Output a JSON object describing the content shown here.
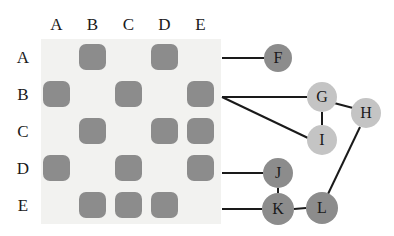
{
  "figure": {
    "colors": {
      "matrix_background": "#f2f2f0",
      "filled_cell": "#8c8c8c",
      "node_dark": "#8c8c8c",
      "node_light": "#c4c4c4",
      "edge": "#1a1a1a",
      "text": "#1a1a1a",
      "page_background": "#ffffff"
    }
  },
  "matrix": {
    "column_headers": [
      "A",
      "B",
      "C",
      "D",
      "E"
    ],
    "row_headers": [
      "A",
      "B",
      "C",
      "D",
      "E"
    ],
    "rows": [
      {
        "label": "A",
        "cells": [
          0,
          1,
          0,
          1,
          0
        ]
      },
      {
        "label": "B",
        "cells": [
          1,
          0,
          1,
          0,
          1
        ]
      },
      {
        "label": "C",
        "cells": [
          0,
          1,
          0,
          1,
          1
        ]
      },
      {
        "label": "D",
        "cells": [
          1,
          0,
          1,
          0,
          1
        ]
      },
      {
        "label": "E",
        "cells": [
          0,
          1,
          1,
          1,
          0
        ]
      }
    ],
    "geometry": {
      "left": 41,
      "top": 39,
      "width": 180,
      "height": 185,
      "col_x": [
        43,
        79,
        115,
        151,
        187
      ],
      "row_y": [
        44,
        81,
        118,
        155,
        192
      ],
      "cell_size": 27
    }
  },
  "graph": {
    "nodes": [
      {
        "id": "F",
        "label": "F",
        "x": 278,
        "y": 58,
        "r": 14,
        "shade": "dark"
      },
      {
        "id": "G",
        "label": "G",
        "x": 322,
        "y": 97,
        "r": 15,
        "shade": "light"
      },
      {
        "id": "H",
        "label": "H",
        "x": 366,
        "y": 113,
        "r": 15,
        "shade": "light"
      },
      {
        "id": "I",
        "label": "I",
        "x": 322,
        "y": 140,
        "r": 15,
        "shade": "light"
      },
      {
        "id": "J",
        "label": "J",
        "x": 278,
        "y": 173,
        "r": 15,
        "shade": "dark"
      },
      {
        "id": "K",
        "label": "K",
        "x": 278,
        "y": 209,
        "r": 16,
        "shade": "dark"
      },
      {
        "id": "L",
        "label": "L",
        "x": 322,
        "y": 208,
        "r": 16,
        "shade": "dark"
      }
    ],
    "edges": [
      {
        "from": "row-A",
        "to": "F",
        "x1": 222,
        "y1": 58,
        "x2": 264,
        "y2": 58
      },
      {
        "from": "row-B",
        "to": "G",
        "x1": 222,
        "y1": 97,
        "x2": 307,
        "y2": 97
      },
      {
        "from": "row-B",
        "to": "I",
        "x1": 222,
        "y1": 97,
        "x2": 308,
        "y2": 138
      },
      {
        "from": "G",
        "to": "I",
        "x1": 322,
        "y1": 112,
        "x2": 322,
        "y2": 125
      },
      {
        "from": "G",
        "to": "H",
        "x1": 334,
        "y1": 103,
        "x2": 353,
        "y2": 108
      },
      {
        "from": "H",
        "to": "L",
        "x1": 360,
        "y1": 127,
        "x2": 328,
        "y2": 194
      },
      {
        "from": "row-D",
        "to": "J",
        "x1": 222,
        "y1": 173,
        "x2": 263,
        "y2": 173
      },
      {
        "from": "J",
        "to": "K",
        "x1": 278,
        "y1": 188,
        "x2": 278,
        "y2": 193
      },
      {
        "from": "row-E",
        "to": "K",
        "x1": 222,
        "y1": 209,
        "x2": 262,
        "y2": 209
      },
      {
        "from": "K",
        "to": "L",
        "x1": 294,
        "y1": 209,
        "x2": 306,
        "y2": 208
      }
    ]
  }
}
